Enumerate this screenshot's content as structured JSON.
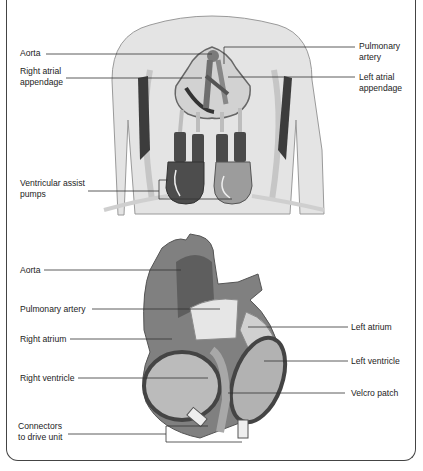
{
  "figure": {
    "top_panel": {
      "name": "Torso with ventricular assist device",
      "labels": [
        {
          "id": "aorta",
          "text": "Aorta",
          "side": "left"
        },
        {
          "id": "right_atrial_appendage",
          "text": "Right atrial\nappendage",
          "side": "left"
        },
        {
          "id": "ventricular_assist_pumps",
          "text": "Ventricular assist\npumps",
          "side": "left"
        },
        {
          "id": "pulmonary_artery",
          "text": "Pulmonary\nartery",
          "side": "right"
        },
        {
          "id": "left_atrial_appendage",
          "text": "Left atrial\nappendage",
          "side": "right"
        }
      ]
    },
    "bottom_panel": {
      "name": "Heart with biventricular cups",
      "labels": [
        {
          "id": "aorta",
          "text": "Aorta",
          "side": "left"
        },
        {
          "id": "pulmonary_artery",
          "text": "Pulmonary artery",
          "side": "left"
        },
        {
          "id": "right_atrium",
          "text": "Right atrium",
          "side": "left"
        },
        {
          "id": "right_ventricle",
          "text": "Right ventricle",
          "side": "left"
        },
        {
          "id": "connectors",
          "text": "Connectors\nto drive unit",
          "side": "left"
        },
        {
          "id": "left_atrium",
          "text": "Left atrium",
          "side": "right"
        },
        {
          "id": "left_ventricle",
          "text": "Left ventricle",
          "side": "right"
        },
        {
          "id": "velcro_patch",
          "text": "Velcro patch",
          "side": "right"
        }
      ]
    },
    "colors": {
      "frame": "#444444",
      "leader_line": "#333333",
      "skin": "#e3e3e3",
      "organ_dark": "#5a5a5a",
      "organ_mid": "#8c8c8c",
      "organ_light": "#cfcfcf"
    }
  }
}
